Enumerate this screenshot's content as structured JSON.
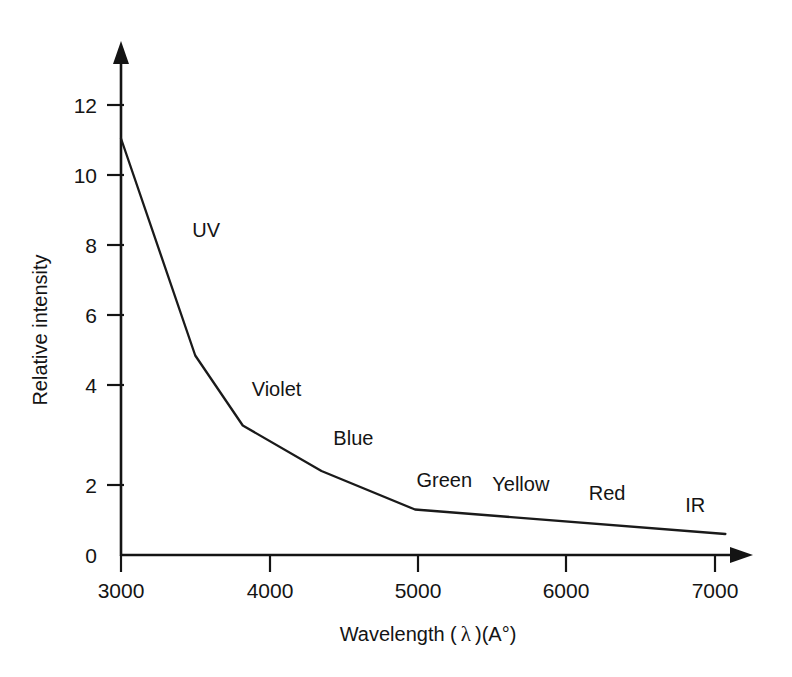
{
  "chart_data": {
    "type": "line",
    "title": "",
    "xlabel": "Wavelength ( λ )(A°)",
    "ylabel": "Relative intensity",
    "xlim": [
      3000,
      7200
    ],
    "ylim": [
      0,
      13.2
    ],
    "xticks": [
      3000,
      4000,
      5000,
      6000,
      7000
    ],
    "xtick_labels": [
      "3000",
      "4000",
      "5000",
      "6000",
      "7000"
    ],
    "yticks": [
      0,
      2,
      4,
      6,
      8,
      10,
      12
    ],
    "ytick_labels": [
      "0",
      "2",
      "4",
      "6",
      "8",
      "10",
      "12"
    ],
    "grid": false,
    "legend": "none",
    "series": [
      {
        "name": "Relative intensity vs wavelength",
        "color": "#1a1a1a",
        "x": [
          3000,
          3500,
          3820,
          4350,
          4980,
          7070
        ],
        "y": [
          11.9,
          5.7,
          3.7,
          2.4,
          1.3,
          0.6
        ]
      }
    ],
    "annotations": [
      {
        "text": "UV",
        "x": 3480,
        "y": 9.1
      },
      {
        "text": "Violet",
        "x": 3880,
        "y": 4.55
      },
      {
        "text": "Blue",
        "x": 4430,
        "y": 3.15
      },
      {
        "text": "Green",
        "x": 4990,
        "y": 1.95
      },
      {
        "text": "Yellow",
        "x": 5500,
        "y": 1.82
      },
      {
        "text": "Red",
        "x": 6150,
        "y": 1.58
      },
      {
        "text": "IR",
        "x": 6800,
        "y": 1.22
      }
    ]
  },
  "axis_titles": {
    "x_prefix": "Wavelength (",
    "x_lambda": "λ",
    "x_suffix": ")(A°)",
    "y": "Relative intensity"
  },
  "colors": {
    "ink": "#141414",
    "curve": "#1a1a1a",
    "background": "#ffffff"
  }
}
